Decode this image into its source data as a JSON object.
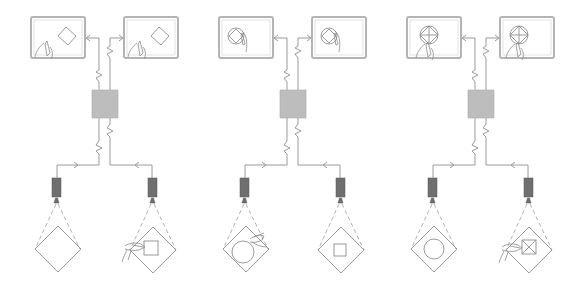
{
  "figure": {
    "title": "Multi-station collaborative drawing system diagram",
    "caption": "",
    "colors": {
      "background": "#ffffff",
      "line": "#9a9a9a",
      "monitor_frame": "#b4b4b4",
      "hub": "#bdbdbd",
      "camera": "#6f6f6f"
    }
  },
  "panels": [
    {
      "id": "panel-1",
      "offset_x": 0,
      "monitors": [
        {
          "side": "left",
          "content": "rotated-square-with-hand"
        },
        {
          "side": "right",
          "content": "rotated-square-with-hand"
        }
      ],
      "stations": [
        {
          "side": "left",
          "workpiece": "diamond",
          "inner_shape": "none",
          "hand": false
        },
        {
          "side": "right",
          "workpiece": "diamond",
          "inner_shape": "square",
          "hand": true
        }
      ]
    },
    {
      "id": "panel-2",
      "offset_x": 188,
      "monitors": [
        {
          "side": "left",
          "content": "circle-square-with-hand"
        },
        {
          "side": "right",
          "content": "circle-square-with-hand"
        }
      ],
      "stations": [
        {
          "side": "left",
          "workpiece": "diamond",
          "inner_shape": "circle",
          "hand": true
        },
        {
          "side": "right",
          "workpiece": "diamond",
          "inner_shape": "square",
          "hand": false
        }
      ]
    },
    {
      "id": "panel-3",
      "offset_x": 376,
      "monitors": [
        {
          "side": "left",
          "content": "circle-cross-diamond-with-hand"
        },
        {
          "side": "right",
          "content": "circle-cross-diamond-with-hand"
        }
      ],
      "stations": [
        {
          "side": "left",
          "workpiece": "diamond",
          "inner_shape": "circle",
          "hand": false
        },
        {
          "side": "right",
          "workpiece": "diamond",
          "inner_shape": "square-with-x",
          "hand": true
        }
      ]
    }
  ]
}
